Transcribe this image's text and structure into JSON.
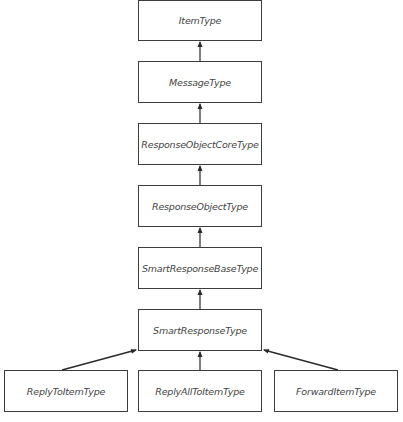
{
  "diagram": {
    "type": "class-inheritance-hierarchy",
    "nodes": [
      {
        "id": "item",
        "label": "ItemType"
      },
      {
        "id": "msg",
        "label": "MessageType"
      },
      {
        "id": "roc",
        "label": "ResponseObjectCoreType"
      },
      {
        "id": "ro",
        "label": "ResponseObjectType"
      },
      {
        "id": "srb",
        "label": "SmartResponseBaseType"
      },
      {
        "id": "sr",
        "label": "SmartResponseType"
      },
      {
        "id": "reply",
        "label": "ReplyToItemType"
      },
      {
        "id": "rall",
        "label": "ReplyAllToItemType"
      },
      {
        "id": "fwd",
        "label": "ForwardItemType"
      }
    ],
    "edges": [
      {
        "from": "msg",
        "to": "item"
      },
      {
        "from": "roc",
        "to": "msg"
      },
      {
        "from": "ro",
        "to": "roc"
      },
      {
        "from": "srb",
        "to": "ro"
      },
      {
        "from": "sr",
        "to": "srb"
      },
      {
        "from": "reply",
        "to": "sr"
      },
      {
        "from": "rall",
        "to": "sr"
      },
      {
        "from": "fwd",
        "to": "sr"
      }
    ],
    "colors": {
      "border": "#3c3c3c",
      "text": "#444444",
      "arrow": "#2a2a2a",
      "background": "#ffffff"
    }
  }
}
